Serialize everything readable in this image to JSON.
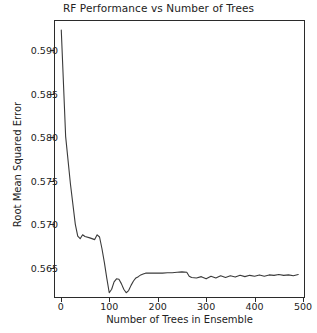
{
  "figure": {
    "background_color": "#ffffff",
    "axes_color": "#2b2b2b",
    "line_color": "#3a3a3a"
  },
  "chart_data": {
    "type": "line",
    "title": "RF Performance vs Number of Trees",
    "xlabel": "Number of Trees in Ensemble",
    "ylabel": "Root Mean Squared Error",
    "xlim": [
      -14,
      504
    ],
    "ylim": [
      0.56155,
      0.59345
    ],
    "xticks": [
      0,
      100,
      200,
      300,
      400,
      500
    ],
    "xtick_labels": [
      "0",
      "100",
      "200",
      "300",
      "400",
      "500"
    ],
    "yticks": [
      0.565,
      0.57,
      0.575,
      0.58,
      0.585,
      0.59
    ],
    "ytick_labels": [
      "0.565",
      "0.570",
      "0.575",
      "0.580",
      "0.585",
      "0.590"
    ],
    "grid": false,
    "legend": null,
    "series": [
      {
        "name": "RMSE",
        "color": "#3a3a3a",
        "x": [
          1,
          10,
          20,
          30,
          35,
          40,
          45,
          50,
          60,
          70,
          75,
          80,
          85,
          90,
          95,
          100,
          105,
          110,
          115,
          120,
          125,
          130,
          135,
          140,
          145,
          150,
          155,
          160,
          165,
          170,
          175,
          180,
          190,
          200,
          210,
          220,
          230,
          240,
          250,
          260,
          265,
          270,
          280,
          290,
          300,
          310,
          320,
          330,
          340,
          350,
          360,
          370,
          380,
          390,
          400,
          410,
          420,
          430,
          440,
          450,
          460,
          470,
          480,
          490
        ],
        "y": [
          0.5923,
          0.5801,
          0.5746,
          0.57,
          0.56865,
          0.56835,
          0.5688,
          0.5686,
          0.56845,
          0.56825,
          0.5688,
          0.56855,
          0.5672,
          0.5656,
          0.5638,
          0.56215,
          0.56255,
          0.5634,
          0.56375,
          0.5637,
          0.5632,
          0.56255,
          0.56215,
          0.5624,
          0.563,
          0.5635,
          0.56385,
          0.564,
          0.5642,
          0.5643,
          0.5644,
          0.5644,
          0.5644,
          0.5644,
          0.5644,
          0.56445,
          0.56445,
          0.5645,
          0.56455,
          0.5645,
          0.56405,
          0.5639,
          0.56385,
          0.564,
          0.56375,
          0.56405,
          0.56385,
          0.5641,
          0.5639,
          0.5641,
          0.56395,
          0.56415,
          0.564,
          0.56415,
          0.56405,
          0.5642,
          0.56405,
          0.5642,
          0.56415,
          0.56425,
          0.56415,
          0.5642,
          0.5641,
          0.56425
        ]
      }
    ]
  }
}
